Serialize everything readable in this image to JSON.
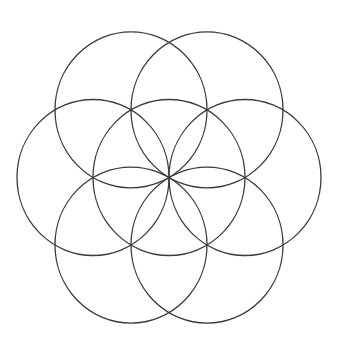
{
  "diagram": {
    "background": "#ffffff",
    "stroke_color": "#3a3a3a",
    "stroke_width": 1.3,
    "center": {
      "x": 169,
      "y": 177.5
    },
    "radius_x": 76,
    "radius_y": 78,
    "circles": [
      {
        "name": "center",
        "dx": 0,
        "dy": 0
      },
      {
        "name": "right",
        "dx": 1,
        "dy": 0
      },
      {
        "name": "upper-right",
        "dx": 0.5,
        "dy": -0.866
      },
      {
        "name": "upper-left",
        "dx": -0.5,
        "dy": -0.866
      },
      {
        "name": "left",
        "dx": -1,
        "dy": 0
      },
      {
        "name": "lower-left",
        "dx": -0.5,
        "dy": 0.866
      },
      {
        "name": "lower-right",
        "dx": 0.5,
        "dy": 0.866
      }
    ]
  }
}
